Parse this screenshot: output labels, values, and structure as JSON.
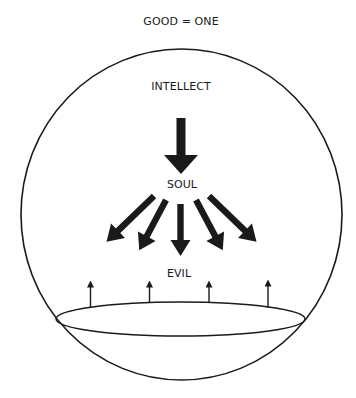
{
  "diagram": {
    "title": "GOOD = ONE",
    "labels": {
      "intellect": "INTELLECT",
      "soul": "SOUL",
      "evil": "EVIL"
    },
    "elements": {
      "outer_circle": "sphere enclosing intellect, soul and matter",
      "main_arrow": "intellect to soul",
      "soul_arrows_count": 5,
      "evil_arrows_count": 4,
      "base_disc": "matter"
    },
    "colors": {
      "ink": "#1a1a1a",
      "background": "#ffffff"
    }
  }
}
